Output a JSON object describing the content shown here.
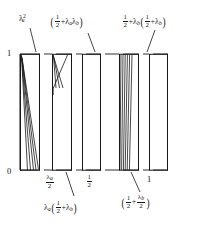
{
  "figure": {
    "kind": "hand-drawn-interval-diagram",
    "ink_color": "#181818",
    "background": "#ffffff"
  },
  "axes": {
    "y_top_tick": "1",
    "origin_tick": "0",
    "x_ticks": [
      {
        "id": "lambda-a-over-2",
        "numerator": "λ",
        "numerator_sub": "a",
        "denominator": "2",
        "x_frac": 0.27
      },
      {
        "id": "one-half",
        "numerator": "1",
        "denominator": "2",
        "x_frac": 0.5
      },
      {
        "id": "one",
        "text": "1",
        "x_frac": 1.0
      }
    ],
    "y_range": [
      0,
      1
    ],
    "x_range": [
      0,
      1
    ]
  },
  "labels": {
    "top_left": {
      "id": "lambda-a-squared",
      "lam": "λ",
      "sub": "a",
      "sup": "2",
      "plain": "λ²ₐ"
    },
    "top_middle": {
      "id": "half-plus-lambda-a-lambda-b",
      "open": "(",
      "frac_num": "1",
      "frac_den": "2",
      "plus": "+",
      "lam1": "λ",
      "sub1": "a",
      "lam2": "λ",
      "sub2": "b",
      "close": ")",
      "plain": "(1/2 + λₐλ_b)"
    },
    "top_right": {
      "id": "half-plus-lambda-b-times-half-plus-lambda-b",
      "frac_num": "1",
      "frac_den": "2",
      "plus1": "+",
      "lam1": "λ",
      "sub1": "b",
      "open": "(",
      "frac2_num": "1",
      "frac2_den": "2",
      "plus2": "+",
      "lam2": "λ",
      "sub2": "b",
      "close": ")",
      "plain": "1/2 + λ_b(1/2 + λ_b)"
    },
    "bottom_left": {
      "id": "lambda-a-times-half-plus-lambda-b",
      "lam0": "λ",
      "sub0": "a",
      "open": "(",
      "frac_num": "1",
      "frac_den": "2",
      "plus": "+",
      "lam1": "λ",
      "sub1": "b",
      "close": ")",
      "plain": "λₐ(1/2 + λ_b)"
    },
    "bottom_right": {
      "id": "half-plus-lambda-b-over-2",
      "open": "(",
      "frac_num": "1",
      "frac_den": "2",
      "plus": "+",
      "frac2_num": "λ",
      "frac2_num_sub": "b",
      "frac2_den": "2",
      "close": ")",
      "plain": "(1/2 + λ_b/2)"
    }
  },
  "blocks": [
    {
      "id": "block-1",
      "x0": 20,
      "x1": 40,
      "hatch": "fan-down-right",
      "lines": 5
    },
    {
      "id": "block-2",
      "x0": 52,
      "x1": 72,
      "hatch": "short-top-diagonals",
      "lines": 3
    },
    {
      "id": "block-3",
      "x0": 82,
      "x1": 101,
      "hatch": "none",
      "lines": 0
    },
    {
      "id": "block-4",
      "x0": 119,
      "x1": 139,
      "hatch": "near-vertical-fan",
      "lines": 6
    },
    {
      "id": "block-5",
      "x0": 149,
      "x1": 168,
      "hatch": "none",
      "lines": 0
    }
  ],
  "colors": {
    "ink": "#181818",
    "paper": "#ffffff"
  }
}
